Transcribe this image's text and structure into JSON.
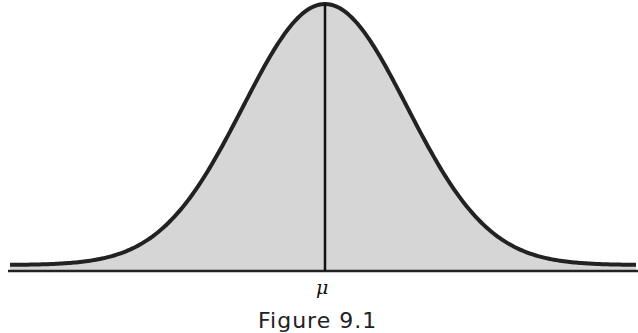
{
  "figure": {
    "type": "normal-distribution-curve",
    "mean_label": "μ",
    "caption": "Figure 9.1",
    "fill_color": "#d6d6d6",
    "stroke_color": "#222222",
    "background": "#ffffff"
  }
}
